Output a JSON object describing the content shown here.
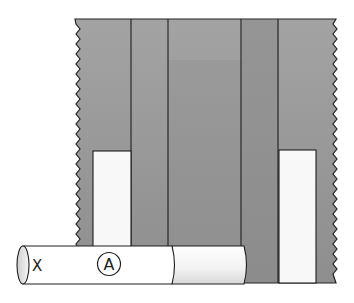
{
  "figure": {
    "type": "illustration",
    "colors": {
      "panel": "#9a9a9a",
      "panel_dark": "#858585",
      "stroke": "#222222",
      "white_bar": "#f7f7f7",
      "tube": "#ffffff",
      "tube_shaded": "#e4e4e4",
      "background": "#ffffff"
    }
  },
  "panel": {
    "vertical_line_count": 4
  },
  "tube": {
    "end_label": "X",
    "circled_label": "A"
  }
}
